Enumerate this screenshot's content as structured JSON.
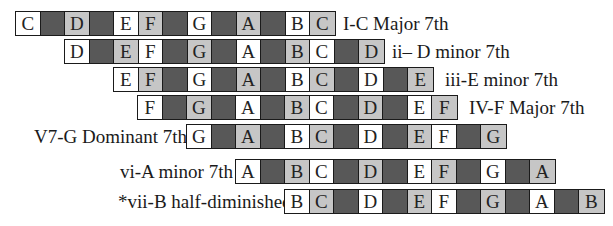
{
  "colors": {
    "chord_tone": "#ffffff",
    "scale_tone": "#c6c6c6",
    "black_key": "#585858",
    "border": "#1a1a1a"
  },
  "chords": [
    {
      "label": "I-C Major 7th",
      "label_side": "right",
      "cells": [
        {
          "note": "C",
          "type": "chord"
        },
        {
          "note": "",
          "type": "black"
        },
        {
          "note": "D",
          "type": "scale"
        },
        {
          "note": "",
          "type": "black"
        },
        {
          "note": "E",
          "type": "chord"
        },
        {
          "note": "F",
          "type": "scale"
        },
        {
          "note": "",
          "type": "black"
        },
        {
          "note": "G",
          "type": "chord"
        },
        {
          "note": "",
          "type": "black"
        },
        {
          "note": "A",
          "type": "scale"
        },
        {
          "note": "",
          "type": "black"
        },
        {
          "note": "B",
          "type": "chord"
        },
        {
          "note": "C",
          "type": "scale"
        }
      ]
    },
    {
      "label": "ii– D minor 7th",
      "label_side": "right",
      "cells": [
        {
          "note": "D",
          "type": "chord"
        },
        {
          "note": "",
          "type": "black"
        },
        {
          "note": "E",
          "type": "scale"
        },
        {
          "note": "F",
          "type": "chord"
        },
        {
          "note": "",
          "type": "black"
        },
        {
          "note": "G",
          "type": "scale"
        },
        {
          "note": "",
          "type": "black"
        },
        {
          "note": "A",
          "type": "chord"
        },
        {
          "note": "",
          "type": "black"
        },
        {
          "note": "B",
          "type": "scale"
        },
        {
          "note": "C",
          "type": "chord"
        },
        {
          "note": "",
          "type": "black"
        },
        {
          "note": "D",
          "type": "scale"
        }
      ]
    },
    {
      "label": "iii-E minor 7th",
      "label_side": "right",
      "cells": [
        {
          "note": "E",
          "type": "chord"
        },
        {
          "note": "F",
          "type": "scale"
        },
        {
          "note": "",
          "type": "black"
        },
        {
          "note": "G",
          "type": "chord"
        },
        {
          "note": "",
          "type": "black"
        },
        {
          "note": "A",
          "type": "scale"
        },
        {
          "note": "",
          "type": "black"
        },
        {
          "note": "B",
          "type": "chord"
        },
        {
          "note": "C",
          "type": "scale"
        },
        {
          "note": "",
          "type": "black"
        },
        {
          "note": "D",
          "type": "chord"
        },
        {
          "note": "",
          "type": "black"
        },
        {
          "note": "E",
          "type": "scale"
        }
      ]
    },
    {
      "label": "IV-F Major 7th",
      "label_side": "right",
      "cells": [
        {
          "note": "F",
          "type": "chord"
        },
        {
          "note": "",
          "type": "black"
        },
        {
          "note": "G",
          "type": "scale"
        },
        {
          "note": "",
          "type": "black"
        },
        {
          "note": "A",
          "type": "chord"
        },
        {
          "note": "",
          "type": "black"
        },
        {
          "note": "B",
          "type": "scale"
        },
        {
          "note": "C",
          "type": "chord"
        },
        {
          "note": "",
          "type": "black"
        },
        {
          "note": "D",
          "type": "scale"
        },
        {
          "note": "",
          "type": "black"
        },
        {
          "note": "E",
          "type": "chord"
        },
        {
          "note": "F",
          "type": "scale"
        }
      ]
    },
    {
      "label": "V7-G Dominant 7th",
      "label_side": "left",
      "cells": [
        {
          "note": "G",
          "type": "chord"
        },
        {
          "note": "",
          "type": "black"
        },
        {
          "note": "A",
          "type": "scale"
        },
        {
          "note": "",
          "type": "black"
        },
        {
          "note": "B",
          "type": "chord"
        },
        {
          "note": "C",
          "type": "scale"
        },
        {
          "note": "",
          "type": "black"
        },
        {
          "note": "D",
          "type": "chord"
        },
        {
          "note": "",
          "type": "black"
        },
        {
          "note": "E",
          "type": "scale"
        },
        {
          "note": "F",
          "type": "chord"
        },
        {
          "note": "",
          "type": "black"
        },
        {
          "note": "G",
          "type": "scale"
        }
      ]
    },
    {
      "label": "vi-A minor 7th",
      "label_side": "left",
      "cells": [
        {
          "note": "A",
          "type": "chord"
        },
        {
          "note": "",
          "type": "black"
        },
        {
          "note": "B",
          "type": "scale"
        },
        {
          "note": "C",
          "type": "chord"
        },
        {
          "note": "",
          "type": "black"
        },
        {
          "note": "D",
          "type": "scale"
        },
        {
          "note": "",
          "type": "black"
        },
        {
          "note": "E",
          "type": "chord"
        },
        {
          "note": "F",
          "type": "scale"
        },
        {
          "note": "",
          "type": "black"
        },
        {
          "note": "G",
          "type": "chord"
        },
        {
          "note": "",
          "type": "black"
        },
        {
          "note": "A",
          "type": "scale"
        }
      ]
    },
    {
      "label": "*vii-B half-diminished",
      "label_side": "left",
      "cells": [
        {
          "note": "B",
          "type": "chord"
        },
        {
          "note": "C",
          "type": "scale"
        },
        {
          "note": "",
          "type": "black"
        },
        {
          "note": "D",
          "type": "chord"
        },
        {
          "note": "",
          "type": "black"
        },
        {
          "note": "E",
          "type": "scale"
        },
        {
          "note": "F",
          "type": "chord"
        },
        {
          "note": "",
          "type": "black"
        },
        {
          "note": "G",
          "type": "scale"
        },
        {
          "note": "",
          "type": "black"
        },
        {
          "note": "A",
          "type": "chord"
        },
        {
          "note": "",
          "type": "black"
        },
        {
          "note": "B",
          "type": "scale"
        }
      ]
    }
  ]
}
